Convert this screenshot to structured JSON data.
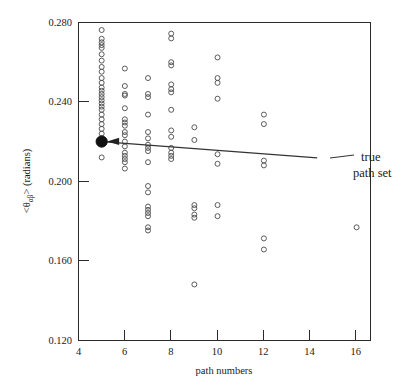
{
  "chart_data": {
    "type": "scatter",
    "title": "",
    "xlabel": "path numbers",
    "ylabel": "<θαβ> (radians)",
    "ylabel_parts": {
      "prefix": "<θ",
      "subscript": "αβ",
      "suffix": "> (radians)"
    },
    "xlim": [
      4,
      16.6
    ],
    "ylim": [
      0.12,
      0.28
    ],
    "xticks": [
      4,
      6,
      8,
      10,
      12,
      14,
      16
    ],
    "xtick_labels": [
      "4",
      "6",
      "8",
      "10",
      "12",
      "14",
      "16"
    ],
    "yticks": [
      0.12,
      0.16,
      0.2,
      0.24,
      0.28
    ],
    "ytick_labels": [
      "0.120",
      "0.160",
      "0.200",
      "0.240",
      "0.280"
    ],
    "grid": false,
    "legend": "none",
    "marker": "open-circle",
    "marker_color": "#4a4a4a",
    "highlight_marker_color": "#111111",
    "points": [
      [
        5,
        0.2762
      ],
      [
        5,
        0.2718
      ],
      [
        5,
        0.27
      ],
      [
        5,
        0.2686
      ],
      [
        5,
        0.2672
      ],
      [
        5,
        0.264
      ],
      [
        5,
        0.2608
      ],
      [
        5,
        0.2576
      ],
      [
        5,
        0.2552
      ],
      [
        5,
        0.252
      ],
      [
        5,
        0.2496
      ],
      [
        5,
        0.2472
      ],
      [
        5,
        0.2456
      ],
      [
        5,
        0.244
      ],
      [
        5,
        0.2424
      ],
      [
        5,
        0.2408
      ],
      [
        5,
        0.2392
      ],
      [
        5,
        0.2376
      ],
      [
        5,
        0.236
      ],
      [
        5,
        0.2336
      ],
      [
        5,
        0.2312
      ],
      [
        5,
        0.2288
      ],
      [
        5,
        0.2264
      ],
      [
        5,
        0.224
      ],
      [
        5,
        0.2216
      ],
      [
        5,
        0.2192
      ],
      [
        5,
        0.22
      ],
      [
        5,
        0.212
      ],
      [
        6,
        0.2568
      ],
      [
        6,
        0.248
      ],
      [
        6,
        0.244
      ],
      [
        6,
        0.2432
      ],
      [
        6,
        0.2368
      ],
      [
        6,
        0.2312
      ],
      [
        6,
        0.2296
      ],
      [
        6,
        0.228
      ],
      [
        6,
        0.2248
      ],
      [
        6,
        0.2232
      ],
      [
        6,
        0.22
      ],
      [
        6,
        0.2176
      ],
      [
        6,
        0.2144
      ],
      [
        6,
        0.2128
      ],
      [
        6,
        0.2112
      ],
      [
        6,
        0.2096
      ],
      [
        6,
        0.2064
      ],
      [
        7,
        0.252
      ],
      [
        7,
        0.244
      ],
      [
        7,
        0.2424
      ],
      [
        7,
        0.2336
      ],
      [
        7,
        0.2248
      ],
      [
        7,
        0.2216
      ],
      [
        7,
        0.2184
      ],
      [
        7,
        0.2168
      ],
      [
        7,
        0.2152
      ],
      [
        7,
        0.2096
      ],
      [
        7,
        0.1976
      ],
      [
        7,
        0.1944
      ],
      [
        7,
        0.1872
      ],
      [
        7,
        0.1856
      ],
      [
        7,
        0.184
      ],
      [
        7,
        0.1824
      ],
      [
        7,
        0.1768
      ],
      [
        7,
        0.1752
      ],
      [
        8,
        0.2744
      ],
      [
        8,
        0.272
      ],
      [
        8,
        0.26
      ],
      [
        8,
        0.2584
      ],
      [
        8,
        0.2488
      ],
      [
        8,
        0.2464
      ],
      [
        8,
        0.2448
      ],
      [
        8,
        0.236
      ],
      [
        8,
        0.2256
      ],
      [
        8,
        0.2224
      ],
      [
        8,
        0.2168
      ],
      [
        8,
        0.2144
      ],
      [
        8,
        0.2128
      ],
      [
        8,
        0.2112
      ],
      [
        9,
        0.2272
      ],
      [
        9,
        0.2208
      ],
      [
        9,
        0.188
      ],
      [
        9,
        0.1864
      ],
      [
        9,
        0.1832
      ],
      [
        9,
        0.1816
      ],
      [
        9,
        0.148
      ],
      [
        10,
        0.2624
      ],
      [
        10,
        0.252
      ],
      [
        10,
        0.2496
      ],
      [
        10,
        0.2416
      ],
      [
        10,
        0.2136
      ],
      [
        10,
        0.2088
      ],
      [
        10,
        0.188
      ],
      [
        10,
        0.1824
      ],
      [
        12,
        0.2336
      ],
      [
        12,
        0.2288
      ],
      [
        12,
        0.2104
      ],
      [
        12,
        0.208
      ],
      [
        12,
        0.1712
      ],
      [
        12,
        0.1656
      ],
      [
        16,
        0.1768
      ]
    ],
    "highlight_point": {
      "x": 5,
      "y": 0.22,
      "label": "true path set"
    },
    "trendline": {
      "x0": 5.15,
      "y0": 0.2198,
      "x1": 14.3,
      "y1": 0.2118
    },
    "annotations": [
      {
        "text": "true",
        "x": 14.9,
        "y": 0.215
      },
      {
        "text": "path set",
        "x": 14.9,
        "y": 0.2045
      }
    ]
  },
  "annotation_text": {
    "line1": "true",
    "line2": "path set"
  }
}
